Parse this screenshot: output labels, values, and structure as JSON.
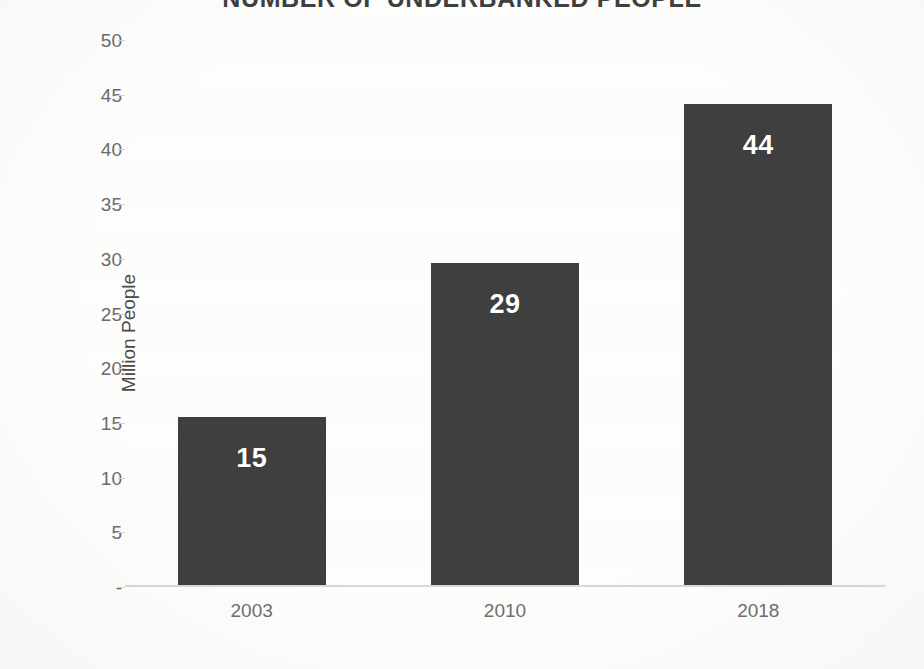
{
  "chart_data": {
    "type": "bar",
    "title": "NUMBER OF UNDERBANKED PEOPLE",
    "categories": [
      "2003",
      "2010",
      "2018"
    ],
    "values": [
      15,
      29,
      44
    ],
    "bar_heights": [
      15.4,
      29.4,
      44.0
    ],
    "data_labels": [
      "15",
      "29",
      "44"
    ],
    "xlabel": "",
    "ylabel": "Million People",
    "ylim": [
      0,
      50
    ],
    "y_ticks": [
      0,
      5,
      10,
      15,
      20,
      25,
      30,
      35,
      40,
      45,
      50
    ],
    "y_tick_labels": [
      "-",
      "5",
      "10",
      "15",
      "20",
      "25",
      "30",
      "35",
      "40",
      "45",
      "50"
    ],
    "grid": false,
    "legend": null,
    "legend_position": "none",
    "colors": {
      "bar": "#3f3f3f",
      "data_label": "#ffffff",
      "axis_line": "#d9d9d9",
      "tick_label": "#6b6b6b",
      "axis_title": "#4a4a4a",
      "title": "#3f3f3f",
      "background": "#fdfdfc"
    }
  }
}
